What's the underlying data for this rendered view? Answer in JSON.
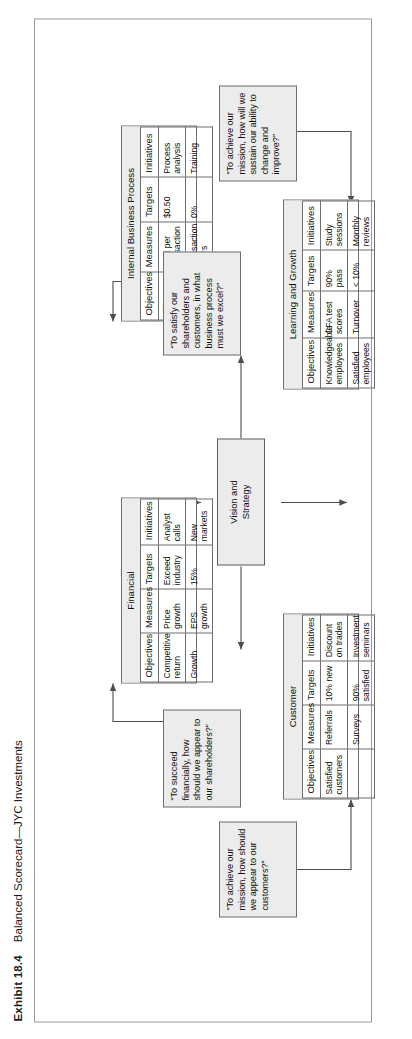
{
  "exhibit": {
    "number": "Exhibit 18.4",
    "title": "Balanced Scorecard—JYC Investments"
  },
  "center": {
    "label": "Vision and\nStrategy"
  },
  "questions": {
    "financial": "“To succeed financially, how should we appear to our shareholders?”",
    "customer": "“To achieve our mission, how should we appear to our customers?”",
    "internal": "“To satisfy our shareholders and customers, in what business process must we excel?”",
    "learning": "“To achieve our mission, how will we sustain our ability to change and improve?”"
  },
  "columns": [
    "Objectives",
    "Measures",
    "Targets",
    "Initiatives"
  ],
  "perspectives": [
    {
      "key": "financial",
      "name": "Financial",
      "rows": [
        {
          "objective": "Competitive return",
          "measure": "Price growth",
          "target": "Exceed industry",
          "initiative": "Analyst calls"
        },
        {
          "objective": "Growth",
          "measure": "EPS growth",
          "target": "15%",
          "initiative": "New markets"
        }
      ]
    },
    {
      "key": "customer",
      "name": "Customer",
      "rows": [
        {
          "objective": "Satisfied customers",
          "measure": "Referrals",
          "target": "10% new",
          "initiative": "Discount on trades"
        },
        {
          "objective": "",
          "measure": "Surveys",
          "target": "90% satisfied",
          "initiative": "Investment seminars"
        }
      ]
    },
    {
      "key": "internal",
      "name": "Internal Business Process",
      "rows": [
        {
          "objective": "Efficient processing",
          "measure": "Cost per transaction",
          "target": "$0.50",
          "initiative": "Process analysis"
        },
        {
          "objective": "Zero defects",
          "measure": "Transaction errors",
          "target": "0%",
          "initiative": "Training"
        }
      ]
    },
    {
      "key": "learning",
      "name": "Learning and Growth",
      "rows": [
        {
          "objective": "Knowledgeable employees",
          "measure": "CFA test scores",
          "target": "90% pass",
          "initiative": "Study sessions"
        },
        {
          "objective": "Satisfied employees",
          "measure": "Turnover",
          "target": "< 10%",
          "initiative": "Monthly reviews"
        }
      ]
    }
  ],
  "colors": {
    "fill": "#ececec",
    "line": "#6f6f6f",
    "frame": "#9a9a9a"
  }
}
